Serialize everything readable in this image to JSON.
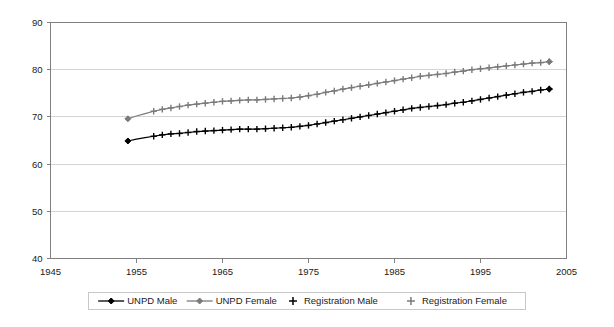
{
  "chart_data": {
    "type": "line",
    "title": "",
    "subtitle": "",
    "xlabel": "",
    "ylabel": "",
    "xlim": [
      1945,
      2005
    ],
    "ylim": [
      40,
      90
    ],
    "xticks": [
      1945,
      1955,
      1965,
      1975,
      1985,
      1995,
      2005
    ],
    "yticks": [
      40,
      50,
      60,
      70,
      80,
      90
    ],
    "grid": "horizontal",
    "legend_position": "bottom",
    "colors": {
      "male": "#000000",
      "female": "#7a7a7a",
      "grid": "#d4d4d4",
      "axis": "#808080",
      "background": "#ffffff"
    },
    "x": [
      1954,
      1955,
      1956,
      1957,
      1958,
      1959,
      1960,
      1961,
      1962,
      1963,
      1964,
      1965,
      1966,
      1967,
      1968,
      1969,
      1970,
      1971,
      1972,
      1973,
      1974,
      1975,
      1976,
      1977,
      1978,
      1979,
      1980,
      1981,
      1982,
      1983,
      1984,
      1985,
      1986,
      1987,
      1988,
      1989,
      1990,
      1991,
      1992,
      1993,
      1994,
      1995,
      1996,
      1997,
      1998,
      1999,
      2000,
      2001,
      2002,
      2003
    ],
    "series": [
      {
        "name": "UNPD Male",
        "marker": "diamond",
        "line": "solid",
        "color": "#000000",
        "values": [
          64.9,
          65.3,
          65.6,
          65.9,
          66.2,
          66.4,
          66.5,
          66.7,
          66.9,
          67.0,
          67.1,
          67.2,
          67.3,
          67.4,
          67.4,
          67.4,
          67.5,
          67.6,
          67.7,
          67.8,
          68.0,
          68.2,
          68.5,
          68.8,
          69.1,
          69.4,
          69.7,
          70.0,
          70.3,
          70.6,
          70.9,
          71.2,
          71.5,
          71.8,
          72.0,
          72.2,
          72.4,
          72.6,
          72.9,
          73.1,
          73.4,
          73.7,
          74.0,
          74.3,
          74.6,
          74.9,
          75.2,
          75.4,
          75.7,
          75.9
        ]
      },
      {
        "name": "UNPD Female",
        "marker": "diamond",
        "line": "solid",
        "color": "#7a7a7a",
        "values": [
          69.6,
          70.2,
          70.7,
          71.2,
          71.6,
          71.9,
          72.2,
          72.5,
          72.7,
          72.9,
          73.1,
          73.3,
          73.4,
          73.5,
          73.6,
          73.6,
          73.7,
          73.8,
          73.9,
          74.0,
          74.2,
          74.5,
          74.8,
          75.2,
          75.5,
          75.9,
          76.2,
          76.5,
          76.8,
          77.1,
          77.4,
          77.7,
          78.0,
          78.3,
          78.6,
          78.8,
          79.0,
          79.2,
          79.5,
          79.7,
          80.0,
          80.2,
          80.4,
          80.6,
          80.8,
          81.0,
          81.2,
          81.4,
          81.5,
          81.7
        ]
      },
      {
        "name": "Registration Male",
        "marker": "plus",
        "line": "none",
        "color": "#000000",
        "values": [
          null,
          null,
          null,
          65.9,
          66.2,
          66.4,
          66.5,
          66.7,
          66.9,
          67.0,
          67.1,
          67.2,
          67.3,
          67.4,
          67.4,
          67.4,
          67.5,
          67.6,
          67.7,
          67.8,
          68.0,
          68.2,
          68.5,
          68.8,
          69.1,
          69.4,
          69.7,
          70.0,
          70.3,
          70.6,
          70.9,
          71.2,
          71.5,
          71.8,
          72.0,
          72.2,
          72.4,
          72.6,
          72.9,
          73.1,
          73.4,
          73.7,
          74.0,
          74.3,
          74.6,
          74.9,
          75.2,
          75.4,
          75.7,
          75.9
        ]
      },
      {
        "name": "Registration Female",
        "marker": "plus",
        "line": "none",
        "color": "#7a7a7a",
        "values": [
          null,
          null,
          null,
          71.2,
          71.6,
          71.9,
          72.2,
          72.5,
          72.7,
          72.9,
          73.1,
          73.3,
          73.4,
          73.5,
          73.6,
          73.6,
          73.7,
          73.8,
          73.9,
          74.0,
          74.2,
          74.5,
          74.8,
          75.2,
          75.5,
          75.9,
          76.2,
          76.5,
          76.8,
          77.1,
          77.4,
          77.7,
          78.0,
          78.3,
          78.6,
          78.8,
          79.0,
          79.2,
          79.5,
          79.7,
          80.0,
          80.2,
          80.4,
          80.6,
          80.8,
          81.0,
          81.2,
          81.4,
          81.5,
          81.7
        ]
      }
    ]
  },
  "legend": {
    "items": [
      {
        "label": "UNPD Male",
        "marker": "diamond-line",
        "color": "#000000"
      },
      {
        "label": "UNPD Female",
        "marker": "diamond-line",
        "color": "#7a7a7a"
      },
      {
        "label": "Registration Male",
        "marker": "plus",
        "color": "#000000"
      },
      {
        "label": "Registration Female",
        "marker": "plus",
        "color": "#7a7a7a"
      }
    ]
  }
}
